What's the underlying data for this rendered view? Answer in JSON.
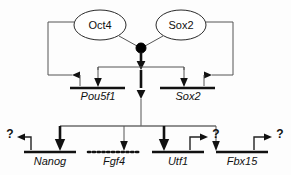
{
  "diagram": {
    "type": "gene-regulatory-network",
    "background_color": "#fdfdfd",
    "line_color": "#111111",
    "node_color": "#000000",
    "transcription_factors": [
      {
        "id": "oct4",
        "label": "Oct4",
        "shape": "ellipse",
        "cx": 100,
        "cy": 25,
        "rx": 26,
        "ry": 15
      },
      {
        "id": "sox2",
        "label": "Sox2",
        "shape": "ellipse",
        "cx": 181,
        "cy": 25,
        "rx": 25,
        "ry": 15
      }
    ],
    "complex_node": {
      "id": "oct4-sox2-complex",
      "label": "",
      "cx": 141,
      "cy": 48,
      "r": 5
    },
    "target_genes": [
      {
        "id": "pou5f1",
        "label": "Pou5f1",
        "bar_style": "solid",
        "x1": 70,
        "x2": 125,
        "y": 88,
        "label_x": 98,
        "label_y": 100
      },
      {
        "id": "sox2-gene",
        "label": "Sox2",
        "bar_style": "solid",
        "x1": 160,
        "x2": 215,
        "y": 88,
        "label_x": 188,
        "label_y": 100
      },
      {
        "id": "nanog",
        "label": "Nanog",
        "bar_style": "solid",
        "x1": 24,
        "x2": 76,
        "y": 152,
        "label_x": 50,
        "label_y": 165
      },
      {
        "id": "fgf4",
        "label": "Fgf4",
        "bar_style": "dotted",
        "x1": 88,
        "x2": 140,
        "y": 152,
        "label_x": 114,
        "label_y": 165
      },
      {
        "id": "utf1",
        "label": "Utf1",
        "bar_style": "solid",
        "x1": 152,
        "x2": 204,
        "y": 152,
        "label_x": 178,
        "label_y": 165
      },
      {
        "id": "fbx15",
        "label": "Fbx15",
        "bar_style": "solid",
        "x1": 216,
        "x2": 268,
        "y": 152,
        "label_x": 242,
        "label_y": 165
      }
    ],
    "unknown_targets": [
      {
        "id": "nanog-unknown",
        "label": "?",
        "x": 10,
        "y": 134
      },
      {
        "id": "utf1-unknown",
        "label": "?",
        "x": 215,
        "y": 134
      },
      {
        "id": "fbx15-unknown",
        "label": "?",
        "x": 279,
        "y": 134
      }
    ],
    "edges": [
      {
        "from": "oct4",
        "to": "complex",
        "kind": "association",
        "style": "thin"
      },
      {
        "from": "sox2",
        "to": "complex",
        "kind": "association",
        "style": "thin"
      },
      {
        "from": "complex",
        "to": "pou5f1",
        "kind": "activation",
        "style": "thin"
      },
      {
        "from": "complex",
        "to": "sox2-gene",
        "kind": "activation",
        "style": "thin"
      },
      {
        "from": "complex",
        "to": "bus",
        "kind": "activation",
        "style": "thick"
      },
      {
        "from": "pou5f1",
        "to": "oct4",
        "kind": "feedback",
        "style": "thin"
      },
      {
        "from": "sox2-gene",
        "to": "sox2",
        "kind": "feedback",
        "style": "thin"
      },
      {
        "from": "bus",
        "to": "nanog",
        "kind": "activation",
        "style": "thick"
      },
      {
        "from": "bus",
        "to": "fgf4",
        "kind": "activation",
        "style": "thin"
      },
      {
        "from": "bus",
        "to": "utf1",
        "kind": "activation",
        "style": "thick"
      },
      {
        "from": "bus",
        "to": "fbx15",
        "kind": "activation",
        "style": "thin"
      },
      {
        "from": "nanog",
        "to": "nanog-unknown",
        "kind": "output",
        "style": "thin"
      },
      {
        "from": "utf1",
        "to": "utf1-unknown",
        "kind": "output",
        "style": "thin"
      },
      {
        "from": "fbx15",
        "to": "fbx15-unknown",
        "kind": "output",
        "style": "thin"
      }
    ]
  }
}
